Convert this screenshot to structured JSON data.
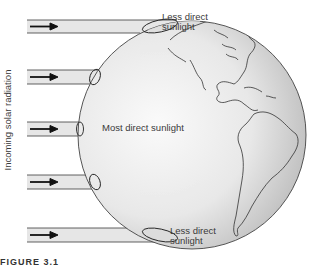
{
  "diagram": {
    "side_label": "Incoming solar radiation",
    "labels": {
      "top": [
        "Less direct",
        "sunlight"
      ],
      "middle": "Most direct sunlight",
      "bottom": [
        "Less direct",
        "sunlight"
      ]
    },
    "caption": "FIGURE 3.1"
  },
  "colors": {
    "beam_fill": "#e6e6e6",
    "beam_stroke": "#3a3a3a",
    "arrow": "#111111",
    "globe_light": "#f4f4f4",
    "globe_dark": "#b8b8b8",
    "coastline": "#333333",
    "text": "#3a3a3a"
  },
  "beams": [
    {
      "y": 20,
      "h": 13,
      "x_end": 152
    },
    {
      "y": 70,
      "h": 14,
      "x_end": 97
    },
    {
      "y": 122,
      "h": 14,
      "x_end": 80
    },
    {
      "y": 175,
      "h": 14,
      "x_end": 97
    },
    {
      "y": 228,
      "h": 14,
      "x_end": 165
    }
  ]
}
